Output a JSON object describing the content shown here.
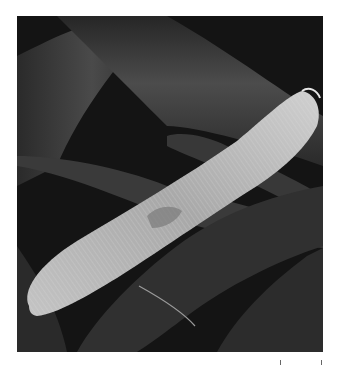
{
  "image": {
    "subject": "Scanning electron micrograph of a paramecium",
    "alt": "SEM image of a ciliated paramecium lying diagonally across cylindrical fibers",
    "colors": {
      "background": "#ffffff",
      "dark_field": "#1a1a1a",
      "fiber": "#3a3a3a",
      "fiber_highlight": "#5a5a5a",
      "organism": "#b8b8b8",
      "organism_highlight": "#d8d8d8"
    }
  }
}
